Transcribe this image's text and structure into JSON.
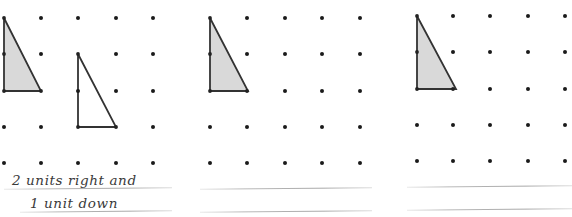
{
  "page": {
    "background_color": "#ffffff",
    "width": 572,
    "height": 217
  },
  "style": {
    "dot_color": "#1a1a1a",
    "dot_radius": 2,
    "shape_stroke_color": "#333333",
    "shape_fill_shaded": "#d9d9d9",
    "shape_fill_plain": "#ffffff",
    "rule_line_color": "#b0b0b0",
    "handwriting_color": "#3a3a3a"
  },
  "panels": [
    {
      "id": "panel-1",
      "name": "worked-example",
      "x": 0,
      "grid": {
        "columns_x": [
          4,
          41,
          78,
          116,
          153
        ],
        "rows_y": [
          18,
          54,
          91,
          127,
          163
        ],
        "hidden_dots": [
          "r0c0",
          "r1c0",
          "r2c0",
          "r2c1",
          "r1c2",
          "r3c2",
          "r3c3"
        ]
      },
      "shapes": [
        {
          "name": "original-triangle",
          "fill": "shaded",
          "points": "4,18 4,91 41,91",
          "label": "pre-image"
        },
        {
          "name": "translated-triangle",
          "fill": "plain",
          "points": "78,54 78,127 116,127",
          "label": "image"
        }
      ],
      "answer_lines": [
        {
          "x": 4,
          "y": 188,
          "width": 168
        },
        {
          "x": 20,
          "y": 211,
          "width": 152
        }
      ],
      "answer_text": [
        {
          "value": "2 units right and",
          "x": 12,
          "y": 172
        },
        {
          "value": "1 unit down",
          "x": 30,
          "y": 195
        }
      ]
    },
    {
      "id": "panel-2",
      "name": "practice-question-1",
      "x": 190,
      "grid": {
        "columns_x": [
          210,
          247,
          285,
          322,
          360
        ],
        "rows_y": [
          18,
          54,
          91,
          127,
          163
        ],
        "hidden_dots": [
          "r0c0",
          "r1c0",
          "r2c0",
          "r2c1"
        ]
      },
      "shapes": [
        {
          "name": "original-triangle",
          "fill": "shaded",
          "points": "210,18 210,91 248,91",
          "label": "pre-image"
        }
      ],
      "answer_lines": [
        {
          "x": 200,
          "y": 188,
          "width": 172
        },
        {
          "x": 200,
          "y": 211,
          "width": 172
        }
      ],
      "answer_text": []
    },
    {
      "id": "panel-3",
      "name": "practice-question-2",
      "x": 380,
      "grid": {
        "columns_x": [
          417,
          453,
          490,
          528,
          565
        ],
        "rows_y": [
          16,
          52,
          89,
          125,
          161
        ],
        "hidden_dots": [
          "r0c0",
          "r1c0",
          "r2c0",
          "r2c1"
        ]
      },
      "shapes": [
        {
          "name": "original-triangle",
          "fill": "shaded",
          "points": "417,16 417,89 456,89",
          "label": "pre-image"
        }
      ],
      "answer_lines": [
        {
          "x": 407,
          "y": 186,
          "width": 165
        },
        {
          "x": 407,
          "y": 209,
          "width": 165
        }
      ],
      "answer_text": []
    }
  ]
}
